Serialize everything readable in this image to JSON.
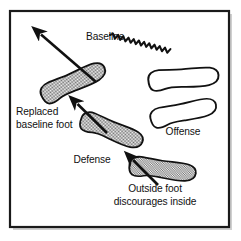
{
  "figure": {
    "frame": {
      "border_color": "#1a1a1a",
      "border_width": 2,
      "fill_color": "#ffffff",
      "x": 10,
      "y": 11,
      "width": 219,
      "height": 216
    },
    "background_color": "#ffffff",
    "ink_color": "#111111",
    "shaded_foot_fill": "#a8a8a8",
    "open_foot_fill": "#ffffff"
  },
  "labels": {
    "baseline": {
      "text": "Baseline",
      "x": 86,
      "y": 40
    },
    "replaced_baseline_foot": {
      "line1": "Replaced",
      "line2": "baseline foot",
      "x": 16,
      "y": 115
    },
    "defense": {
      "text": "Defense",
      "x": 92,
      "y": 163
    },
    "offense": {
      "text": "Offense",
      "x": 183,
      "y": 135
    },
    "outside_foot": {
      "line1": "Outside foot",
      "line2": "discourages inside",
      "x": 155,
      "y": 192
    }
  },
  "shapes": {
    "feet": [
      {
        "name": "replaced-baseline-foot",
        "team": "defense",
        "fill": "shaded",
        "center_x": 72,
        "center_y": 83,
        "rotation_deg": -24
      },
      {
        "name": "defense-foot",
        "team": "defense",
        "fill": "shaded",
        "center_x": 110,
        "center_y": 131,
        "rotation_deg": 22
      },
      {
        "name": "outside-foot",
        "team": "defense",
        "fill": "shaded",
        "center_x": 162,
        "center_y": 170,
        "rotation_deg": 8
      },
      {
        "name": "offense-foot-upper",
        "team": "offense",
        "fill": "open",
        "center_x": 183,
        "center_y": 79,
        "rotation_deg": -4
      },
      {
        "name": "offense-foot-lower",
        "team": "offense",
        "fill": "open",
        "center_x": 183,
        "center_y": 113,
        "rotation_deg": -12
      }
    ],
    "arrows": [
      {
        "name": "baseline-direction-arrow",
        "from_x": 96,
        "from_y": 82,
        "to_x": 38,
        "to_y": 32,
        "points_to": "baseline"
      },
      {
        "name": "replaced-foot-arrow",
        "from_x": 107,
        "from_y": 133,
        "to_x": 74,
        "to_y": 101,
        "points_to": "replaced-baseline-foot"
      },
      {
        "name": "outside-foot-arrow",
        "from_x": 158,
        "from_y": 185,
        "to_x": 130,
        "to_y": 157,
        "points_to": "outside-foot"
      }
    ],
    "ball_path": {
      "name": "ball-path-squiggle",
      "description": "wavy zig-zag line indicating ball flight",
      "start_x": 110,
      "start_y": 35,
      "end_x": 161,
      "end_y": 73,
      "wave_count": 11
    }
  }
}
